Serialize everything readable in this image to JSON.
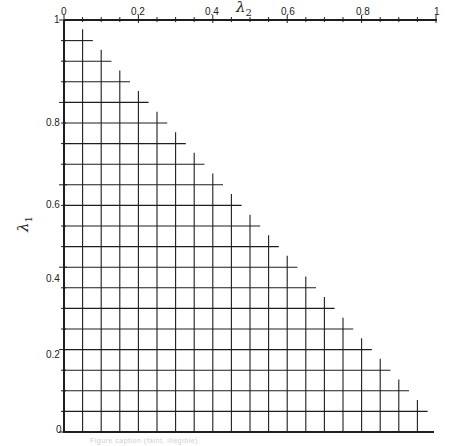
{
  "figure": {
    "type": "staircase grid diagram (simplex discretization)",
    "x_axis": {
      "label": "λ",
      "subscript": "2",
      "position": "top",
      "range": [
        0,
        1
      ],
      "tick_labels": [
        "0",
        "0.2",
        "0.4",
        "0.6",
        "0.8",
        "1"
      ],
      "tick_values": [
        0,
        0.2,
        0.4,
        0.6,
        0.8,
        1
      ],
      "minor_step": 0.05
    },
    "y_axis": {
      "label": "λ",
      "subscript": "1",
      "position": "left",
      "range": [
        0,
        1
      ],
      "tick_labels": [
        "0",
        "0.2",
        "0.4",
        "0.6",
        "0.8",
        "1"
      ],
      "tick_values": [
        0,
        0.2,
        0.4,
        0.6,
        0.8,
        1
      ],
      "minor_step": 0.05
    },
    "grid": {
      "step": 0.05,
      "divisions": 20,
      "region": "λ1 + λ2 ≤ 1 (lower-left triangle, staircase boundary)"
    },
    "caption": "Figure caption (faint, illegible)"
  },
  "chart_data": {
    "type": "grid",
    "title": "",
    "xlabel": "λ2",
    "ylabel": "λ1",
    "xlim": [
      0,
      1
    ],
    "ylim": [
      0,
      1
    ],
    "x_ticks": [
      0,
      0.2,
      0.4,
      0.6,
      0.8,
      1
    ],
    "y_ticks": [
      0,
      0.2,
      0.4,
      0.6,
      0.8,
      1
    ],
    "grid_step": 0.05,
    "boundary": "λ1 + λ2 = 1 (staircase)",
    "grid_on": true,
    "legend": null
  }
}
